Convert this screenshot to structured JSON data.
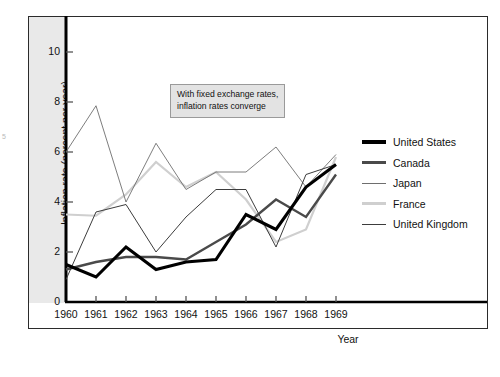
{
  "figure": {
    "edge_artifact": "5"
  },
  "chart_data": {
    "type": "line",
    "title": "",
    "xlabel": "Year",
    "ylabel": "Inflation rate (percent per year)",
    "x": [
      1960,
      1961,
      1962,
      1963,
      1964,
      1965,
      1966,
      1967,
      1968,
      1969
    ],
    "xtick_labels": [
      "1960",
      "1961",
      "1962",
      "1963",
      "1964",
      "1965",
      "1966",
      "1967",
      "1968",
      "1969"
    ],
    "ytick_labels": [
      "0",
      "2",
      "4",
      "6",
      "8",
      "10"
    ],
    "ytick_values": [
      0,
      2,
      4,
      6,
      8,
      10
    ],
    "xlim": [
      1960,
      1969
    ],
    "ylim": [
      0,
      11.4
    ],
    "grid": false,
    "legend_position": "right",
    "annotations": [
      {
        "name": "converge-note",
        "line1": "With fixed exchange rates,",
        "line2": "inflation rates converge"
      }
    ],
    "series": [
      {
        "name": "United States",
        "color": "#000000",
        "width": 3.1,
        "values": [
          1.5,
          1.0,
          2.2,
          1.3,
          1.6,
          1.7,
          3.5,
          2.9,
          4.6,
          5.5
        ]
      },
      {
        "name": "Canada",
        "color": "#4a4a4a",
        "width": 2.4,
        "values": [
          1.3,
          1.6,
          1.8,
          1.8,
          1.7,
          2.4,
          3.1,
          4.1,
          3.4,
          5.1
        ]
      },
      {
        "name": "Japan",
        "color": "#6e6e6e",
        "width": 0.9,
        "values": [
          6.0,
          7.85,
          4.0,
          6.35,
          4.5,
          5.2,
          5.2,
          6.2,
          4.6,
          5.9
        ]
      },
      {
        "name": "France",
        "color": "#cfcfcf",
        "width": 2.2,
        "values": [
          3.5,
          3.45,
          4.3,
          5.6,
          4.6,
          5.2,
          4.1,
          2.4,
          2.9,
          5.8
        ]
      },
      {
        "name": "United Kingdom",
        "color": "#3c3c3c",
        "width": 1.0,
        "values": [
          0.9,
          3.6,
          3.9,
          2.0,
          3.4,
          4.5,
          4.5,
          2.2,
          5.1,
          5.5
        ]
      }
    ]
  }
}
